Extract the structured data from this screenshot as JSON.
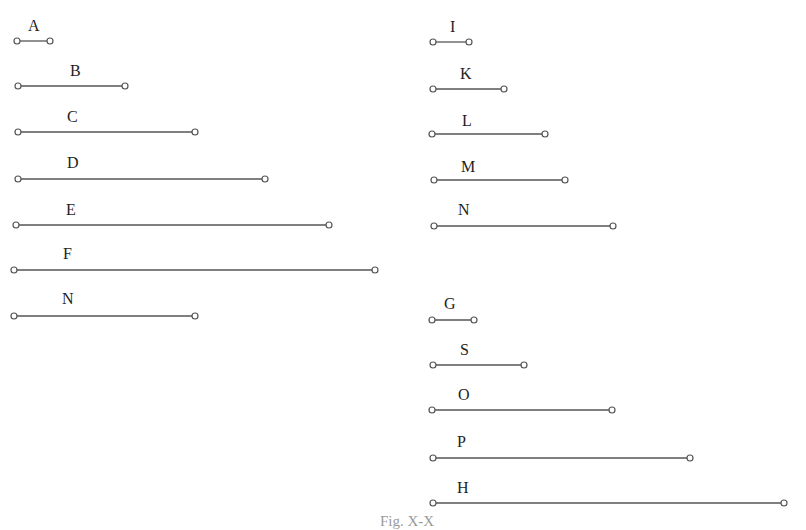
{
  "figure": {
    "caption": "Fig. X-X",
    "stroke_color": "#555555",
    "segments": [
      {
        "label": "A",
        "column": "left",
        "x1": 17,
        "x2": 50,
        "y": 41,
        "label_x": 28,
        "label_y": 18
      },
      {
        "label": "B",
        "column": "left",
        "x1": 18,
        "x2": 125,
        "y": 86,
        "label_x": 70,
        "label_y": 63
      },
      {
        "label": "C",
        "column": "left",
        "x1": 18,
        "x2": 195,
        "y": 132,
        "label_x": 67,
        "label_y": 109
      },
      {
        "label": "D",
        "column": "left",
        "x1": 18,
        "x2": 265,
        "y": 179,
        "label_x": 67,
        "label_y": 155
      },
      {
        "label": "E",
        "column": "left",
        "x1": 16,
        "x2": 329,
        "y": 225,
        "label_x": 66,
        "label_y": 202
      },
      {
        "label": "F",
        "column": "left",
        "x1": 14,
        "x2": 375,
        "y": 270,
        "label_x": 63,
        "label_y": 246
      },
      {
        "label": "N",
        "column": "left",
        "x1": 14,
        "x2": 195,
        "y": 316,
        "label_x": 62,
        "label_y": 291
      },
      {
        "label": "I",
        "column": "right",
        "x1": 433,
        "x2": 469,
        "y": 42,
        "label_x": 450,
        "label_y": 19
      },
      {
        "label": "K",
        "column": "right",
        "x1": 433,
        "x2": 504,
        "y": 89,
        "label_x": 460,
        "label_y": 66
      },
      {
        "label": "L",
        "column": "right",
        "x1": 432,
        "x2": 545,
        "y": 134,
        "label_x": 462,
        "label_y": 113
      },
      {
        "label": "M",
        "column": "right",
        "x1": 434,
        "x2": 565,
        "y": 180,
        "label_x": 461,
        "label_y": 159
      },
      {
        "label": "N",
        "column": "right",
        "x1": 434,
        "x2": 613,
        "y": 226,
        "label_x": 458,
        "label_y": 202
      },
      {
        "label": "G",
        "column": "right",
        "x1": 432,
        "x2": 474,
        "y": 320,
        "label_x": 444,
        "label_y": 296
      },
      {
        "label": "S",
        "column": "right",
        "x1": 433,
        "x2": 524,
        "y": 365,
        "label_x": 460,
        "label_y": 342
      },
      {
        "label": "O",
        "column": "right",
        "x1": 432,
        "x2": 612,
        "y": 410,
        "label_x": 458,
        "label_y": 387
      },
      {
        "label": "P",
        "column": "right",
        "x1": 433,
        "x2": 690,
        "y": 458,
        "label_x": 457,
        "label_y": 434
      },
      {
        "label": "H",
        "column": "right",
        "x1": 433,
        "x2": 784,
        "y": 503,
        "label_x": 457,
        "label_y": 480
      }
    ]
  }
}
